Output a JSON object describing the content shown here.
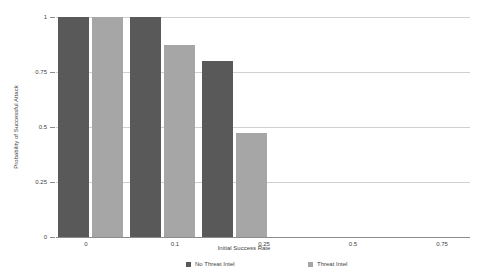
{
  "chart_data": {
    "type": "bar",
    "title": "",
    "xlabel": "Initial Success Rate",
    "ylabel": "Probability of Successful Attack",
    "categories": [
      "0",
      "0.1",
      "0.25"
    ],
    "x_tick_labels": [
      "0",
      "0.1",
      "0.25",
      "0.5",
      "0.75"
    ],
    "y_tick_labels": [
      "0",
      "0.25",
      "0.5",
      "0.75",
      "1"
    ],
    "xlim": [
      -0.05,
      0.85
    ],
    "ylim": [
      0,
      1
    ],
    "grid": true,
    "legend_position": "bottom",
    "series": [
      {
        "name": "No Threat Intel",
        "color": "#595959",
        "values": [
          1.0,
          1.0,
          0.8
        ]
      },
      {
        "name": "Threat Intel",
        "color": "#a6a6a6",
        "values": [
          1.0,
          0.875,
          0.475
        ]
      }
    ]
  },
  "axes": {
    "y_ticks": [
      {
        "label": "1",
        "value": 1.0
      },
      {
        "label": "0.75",
        "value": 0.75
      },
      {
        "label": "0.5",
        "value": 0.5
      },
      {
        "label": "0.25",
        "value": 0.25
      },
      {
        "label": "0",
        "value": 0.0
      }
    ],
    "x_ticks": [
      {
        "label": "0",
        "x_px": 30
      },
      {
        "label": "0.1",
        "x_px": 119
      },
      {
        "label": "0.25",
        "x_px": 208
      },
      {
        "label": "0.5",
        "x_px": 297
      },
      {
        "label": "0.75",
        "x_px": 386
      }
    ]
  },
  "bars": [
    {
      "series": "No Threat Intel",
      "category": "0",
      "value": 1.0,
      "left_px": 2,
      "width_px": 31,
      "color": "#595959"
    },
    {
      "series": "Threat Intel",
      "category": "0",
      "value": 1.0,
      "left_px": 36,
      "width_px": 31,
      "color": "#a6a6a6"
    },
    {
      "series": "No Threat Intel",
      "category": "0.1",
      "value": 1.0,
      "left_px": 74,
      "width_px": 31,
      "color": "#595959"
    },
    {
      "series": "Threat Intel",
      "category": "0.1",
      "value": 0.875,
      "left_px": 108,
      "width_px": 31,
      "color": "#a6a6a6"
    },
    {
      "series": "No Threat Intel",
      "category": "0.25",
      "value": 0.8,
      "left_px": 146,
      "width_px": 31,
      "color": "#595959"
    },
    {
      "series": "Threat Intel",
      "category": "0.25",
      "value": 0.475,
      "left_px": 180,
      "width_px": 31,
      "color": "#a6a6a6"
    }
  ],
  "legend": {
    "items": [
      {
        "label": "No Threat Intel",
        "color": "#595959",
        "left_px": 186
      },
      {
        "label": "Threat Intel",
        "color": "#a6a6a6",
        "left_px": 308
      }
    ]
  }
}
